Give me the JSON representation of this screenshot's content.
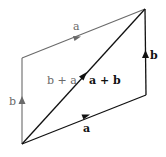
{
  "diagram": {
    "colors": {
      "primary": "#111111",
      "secondary": "#6a6a6a",
      "background": "#ffffff"
    },
    "vertices": {
      "origin": [
        22,
        144
      ],
      "bottom_right": [
        146,
        95
      ],
      "top_right": [
        145,
        9
      ],
      "top_left": [
        22,
        58
      ]
    },
    "edges": [
      {
        "id": "bottom-a",
        "from": "origin",
        "to": "bottom_right",
        "label": "a",
        "style": "primary",
        "bold": true
      },
      {
        "id": "right-b",
        "from": "bottom_right",
        "to": "top_right",
        "label": "b",
        "style": "primary",
        "bold": true
      },
      {
        "id": "left-b",
        "from": "origin",
        "to": "top_left",
        "label": "b",
        "style": "secondary",
        "bold": false
      },
      {
        "id": "top-a",
        "from": "top_left",
        "to": "top_right",
        "label": "a",
        "style": "secondary",
        "bold": false
      },
      {
        "id": "diagonal",
        "from": "origin",
        "to": "top_right",
        "label": "a + b",
        "style": "primary",
        "bold": true
      }
    ],
    "labels": {
      "bottom_a": "a",
      "right_b": "b",
      "left_b": "b",
      "top_a": "a",
      "diag_sum_ab": "a + b",
      "diag_sum_ba": "b + a"
    }
  }
}
